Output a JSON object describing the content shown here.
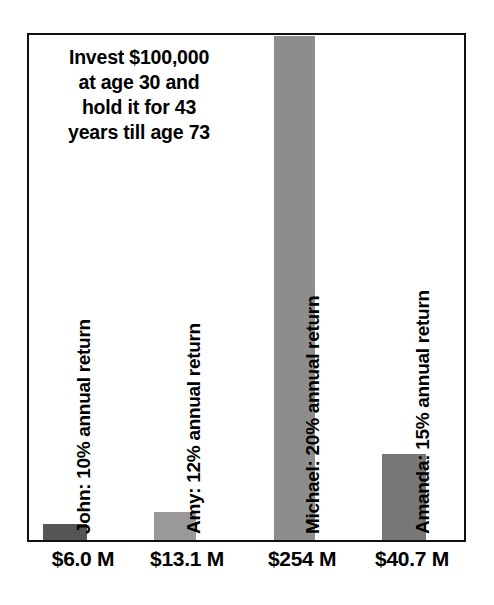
{
  "chart_data": {
    "type": "bar",
    "title": "Invest $100,000 at age 30 and hold it for 43 years till age 73",
    "title_lines": [
      "Invest $100,000",
      "at age 30 and",
      "hold it for 43",
      "years till age 73"
    ],
    "xlabel": "",
    "ylabel": "",
    "ylim": [
      0,
      254
    ],
    "grid": false,
    "legend": "none",
    "categories": [
      "John",
      "Amy",
      "Michael",
      "Amanda"
    ],
    "values": [
      6.0,
      13.1,
      254,
      40.7
    ],
    "value_labels": [
      "$6.0 M",
      "$13.1 M",
      "$254 M",
      "$40.7 M"
    ],
    "series_labels": [
      "John: 10% annual return",
      "Amy: 12% annual return",
      "Michael: 20% annual return",
      "Amanda: 15% annual return"
    ],
    "annual_returns": [
      "10%",
      "12%",
      "20%",
      "15%"
    ],
    "bar_colors": [
      "#555555",
      "#999999",
      "#8d8d8d",
      "#777777"
    ],
    "frame_color": "#111111",
    "background_color": "#ffffff",
    "bars": [
      {
        "name": "John",
        "value": 6.0,
        "label": "$6.0 M",
        "return": "10%",
        "color": "#555555",
        "left": 14,
        "width": 44,
        "height": 16
      },
      {
        "name": "Amy",
        "value": 13.1,
        "label": "$13.1 M",
        "return": "12%",
        "color": "#999999",
        "left": 125,
        "width": 42,
        "height": 28
      },
      {
        "name": "Michael",
        "value": 254,
        "label": "$254 M",
        "return": "20%",
        "color": "#8d8d8d",
        "left": 245,
        "width": 41,
        "height": 504
      },
      {
        "name": "Amanda",
        "value": 40.7,
        "label": "$40.7 M",
        "return": "15%",
        "color": "#777777",
        "left": 353,
        "width": 44,
        "height": 86
      }
    ],
    "label_positions": [
      {
        "left": 66,
        "bottom": 6
      },
      {
        "left": 176,
        "bottom": 6
      },
      {
        "left": 295,
        "bottom": 6
      },
      {
        "left": 405,
        "bottom": 6
      }
    ],
    "xlabel_positions": [
      {
        "left": -4,
        "width": 120
      },
      {
        "left": 100,
        "width": 120
      },
      {
        "left": 215,
        "width": 120
      },
      {
        "left": 325,
        "width": 120
      }
    ]
  }
}
